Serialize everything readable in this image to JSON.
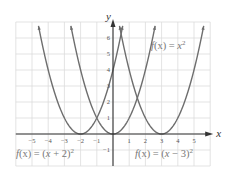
{
  "chart_data": {
    "type": "line",
    "title": "",
    "xlabel": "x",
    "ylabel": "y",
    "xlim": [
      -6,
      6
    ],
    "ylim": [
      -2,
      7
    ],
    "grid": true,
    "x_ticks": [
      -5,
      -4,
      -3,
      -2,
      -1,
      1,
      2,
      3,
      4,
      5
    ],
    "y_ticks": [
      -1,
      1,
      2,
      3,
      4,
      5,
      6
    ],
    "series": [
      {
        "name": "f(x) = (x + 2)^2",
        "equation": "(x+2)^2",
        "vertex": [
          -2,
          0
        ],
        "x_range": [
          -4.6,
          0.6
        ]
      },
      {
        "name": "f(x) = x^2",
        "equation": "x^2",
        "vertex": [
          0,
          0
        ],
        "x_range": [
          -2.6,
          2.6
        ]
      },
      {
        "name": "f(x) = (x - 3)^2",
        "equation": "(x-3)^2",
        "vertex": [
          3,
          0
        ],
        "x_range": [
          0.4,
          5.6
        ]
      }
    ],
    "annotations": [
      {
        "text": "f(x) = x^2",
        "position": "upper right of y-axis near (2.5, 5.5)"
      },
      {
        "text": "f(x) = (x + 2)^2",
        "position": "below x-axis, left"
      },
      {
        "text": "f(x) = (x − 3)^2",
        "position": "below x-axis, right"
      }
    ]
  },
  "labels": {
    "x_axis": "x",
    "y_axis": "y",
    "fn_center": {
      "pre": "f",
      "mid": "(x) = ",
      "var": "x",
      "exp": "2"
    },
    "fn_left": {
      "pre": "f",
      "mid": "(x) = (",
      "var": "x",
      "post": " + 2)",
      "exp": "2"
    },
    "fn_right": {
      "pre": "f",
      "mid": "(x) = (",
      "var": "x",
      "post": " − 3)",
      "exp": "2"
    }
  },
  "colors": {
    "grid": "#dcdcdc",
    "axis": "#333333",
    "curve": "#6e6e6e",
    "label": "#777777"
  }
}
